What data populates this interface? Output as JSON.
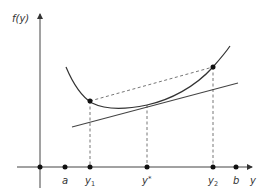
{
  "diagram": {
    "y_axis_label": "f(y)",
    "x_axis_label": "y",
    "x_points": [
      {
        "id": "origin",
        "label": "",
        "x": 40
      },
      {
        "id": "a",
        "label": "a",
        "x": 65
      },
      {
        "id": "y1",
        "label": "y",
        "sub": "1",
        "x": 90
      },
      {
        "id": "ystar",
        "label": "y",
        "sup": "*",
        "x": 147
      },
      {
        "id": "y2",
        "label": "y",
        "sub": "2",
        "x": 213
      },
      {
        "id": "b",
        "label": "b",
        "x": 236
      }
    ],
    "curve_points": [
      {
        "label": "f(y1)",
        "x": 90,
        "y": 101
      },
      {
        "label": "f(y2)",
        "x": 213,
        "y": 67
      }
    ],
    "elements": [
      "convex curve f(y)",
      "tangent line at y*",
      "dashed secant from f(y1) to f(y2)",
      "dashed verticals at y1, y*, y2"
    ],
    "colors": {
      "line": "#333333",
      "dash": "#555555",
      "dot": "#111111"
    }
  }
}
